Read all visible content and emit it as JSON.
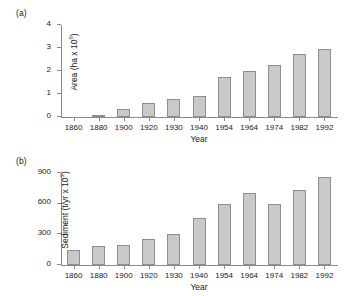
{
  "figure": {
    "panels": [
      {
        "id": "a",
        "panel_label": "(a)",
        "ylabel_main": "Area (ha x 10",
        "ylabel_exp": "6",
        "ylabel_close": ")",
        "xlabel": "Year"
      },
      {
        "id": "b",
        "panel_label": "(b)",
        "ylabel_main": "Sediment (t/yr x 10",
        "ylabel_exp": "3",
        "ylabel_close": ")",
        "xlabel": "Year"
      }
    ]
  },
  "colors": {
    "bar_fill": "#c9c9c9",
    "bar_stroke": "#8e8e8e",
    "axis": "#8a8a8a",
    "text": "#1a1a1a",
    "background": "#ffffff"
  },
  "chart_data": [
    {
      "type": "bar",
      "title": "(a)",
      "xlabel": "Year",
      "ylabel": "Area (ha x 10^6)",
      "categories": [
        "1860",
        "1880",
        "1900",
        "1920",
        "1930",
        "1940",
        "1954",
        "1964",
        "1974",
        "1982",
        "1992"
      ],
      "values": [
        0.0,
        0.1,
        0.33,
        0.63,
        0.77,
        0.93,
        1.76,
        2.0,
        2.26,
        2.76,
        2.94
      ],
      "ylim": [
        0,
        4
      ],
      "yticks": [
        0,
        1,
        2,
        3,
        4
      ],
      "ytick_labels": [
        "0",
        "1",
        "2",
        "3",
        "4"
      ],
      "grid": false,
      "legend": false
    },
    {
      "type": "bar",
      "title": "(b)",
      "xlabel": "Year",
      "ylabel": "Sediment (t/yr x 10^3)",
      "categories": [
        "1860",
        "1880",
        "1900",
        "1920",
        "1930",
        "1940",
        "1954",
        "1964",
        "1974",
        "1982",
        "1992"
      ],
      "values": [
        150,
        188,
        198,
        255,
        305,
        458,
        595,
        705,
        600,
        730,
        865
      ],
      "ylim": [
        0,
        900
      ],
      "yticks": [
        0,
        300,
        600,
        900
      ],
      "ytick_labels": [
        "0",
        "300",
        "600",
        "900"
      ],
      "grid": false,
      "legend": false
    }
  ]
}
